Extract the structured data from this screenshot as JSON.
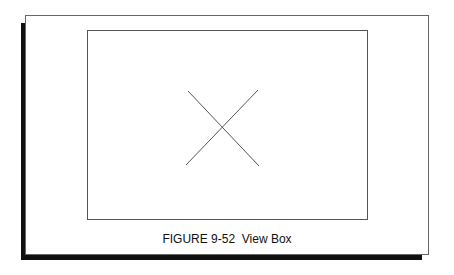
{
  "figure": {
    "caption": "FIGURE 9-52  View Box",
    "view_box": {
      "content": "x-mark",
      "line_color": "#555555"
    },
    "frame_color": "#666666",
    "shadow_color": "#111111"
  }
}
